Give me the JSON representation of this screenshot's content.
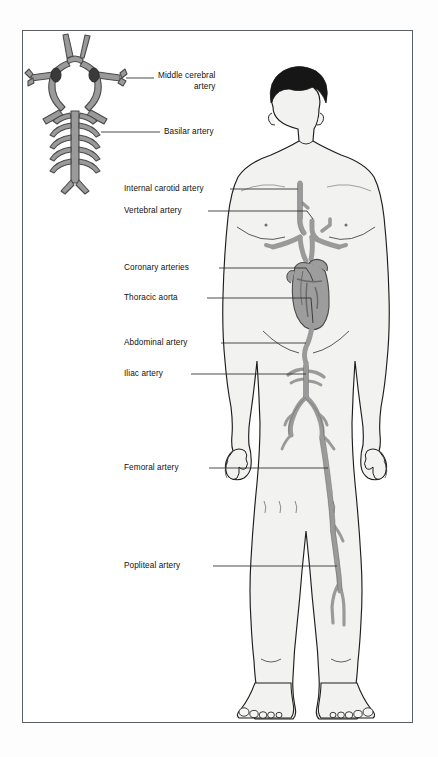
{
  "figure": {
    "frame": {
      "border_color": "#5a5f63",
      "background": "#ffffff"
    },
    "colors": {
      "artery": "#9a9a9a",
      "artery_outline": "#4a4a4a",
      "heart": "#9d9d9d",
      "body_fill": "#f2f2f0",
      "body_outline": "#1d1d1d",
      "hair": "#161616",
      "leader_line": "#2a2a2a",
      "label_text": "#101010"
    },
    "labels": [
      {
        "id": "middle-cerebral-artery",
        "text": "Middle cerebral",
        "text2": "artery",
        "x": 157,
        "y": 75,
        "align": "left"
      },
      {
        "id": "basilar-artery",
        "text": "Basilar artery",
        "x": 163,
        "y": 126,
        "align": "left"
      },
      {
        "id": "internal-carotid-artery",
        "text": "Internal carotid artery",
        "x": 123,
        "y": 185,
        "align": "left"
      },
      {
        "id": "vertebral-artery",
        "text": "Vertebral artery",
        "x": 123,
        "y": 206,
        "align": "left"
      },
      {
        "id": "coronary-arteries",
        "text": "Coronary arteries",
        "x": 123,
        "y": 263,
        "align": "left"
      },
      {
        "id": "thoracic-aorta",
        "text": "Thoracic aorta",
        "x": 123,
        "y": 293,
        "align": "left"
      },
      {
        "id": "abdominal-artery",
        "text": "Abdominal artery",
        "x": 123,
        "y": 338,
        "align": "left"
      },
      {
        "id": "iliac-artery",
        "text": "Iliac artery",
        "x": 123,
        "y": 369,
        "align": "left"
      },
      {
        "id": "femoral-artery",
        "text": "Femoral artery",
        "x": 123,
        "y": 463,
        "align": "left"
      },
      {
        "id": "popliteal-artery",
        "text": "Popliteal artery",
        "x": 123,
        "y": 561,
        "align": "left"
      }
    ],
    "structures": [
      {
        "id": "circle-of-willis",
        "name": "Circle of Willis inset diagram"
      },
      {
        "id": "human-figure",
        "name": "Anterior whole-body male silhouette"
      },
      {
        "id": "heart",
        "name": "Heart"
      },
      {
        "id": "aortic-arch",
        "name": "Aortic arch with brachiocephalic branches"
      },
      {
        "id": "carotid-arteries",
        "name": "Internal carotid arteries in neck"
      },
      {
        "id": "vertebral-arteries",
        "name": "Vertebral arteries"
      },
      {
        "id": "thoracic-aorta-vessel",
        "name": "Descending thoracic aorta"
      },
      {
        "id": "abdominal-aorta-vessel",
        "name": "Abdominal aorta with renal branches"
      },
      {
        "id": "iliac-arteries",
        "name": "Common iliac arteries bifurcation"
      },
      {
        "id": "femoral-artery-vessel",
        "name": "Femoral artery in right thigh"
      },
      {
        "id": "popliteal-artery-vessel",
        "name": "Popliteal artery behind right knee"
      }
    ]
  }
}
